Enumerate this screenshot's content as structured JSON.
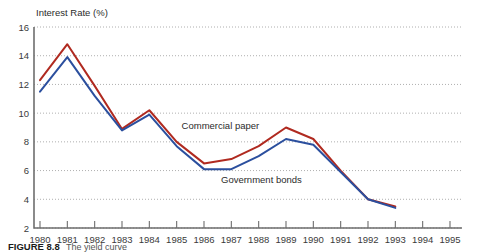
{
  "figure": {
    "caption_number": "FIGURE 8.8",
    "caption_text": "The  yield   curve"
  },
  "chart_data": {
    "type": "line",
    "title": "",
    "subtitle": "",
    "xlabel": "",
    "ylabel": "Interest Rate (%)",
    "ylim": [
      2,
      16
    ],
    "xlim": [
      1980,
      1995
    ],
    "yticks": [
      2,
      4,
      6,
      8,
      10,
      12,
      14,
      16
    ],
    "ytick_labels": [
      "2",
      "4",
      "6",
      "8",
      "10",
      "12",
      "14",
      "16"
    ],
    "grid": true,
    "grid_axis": "y",
    "legend_position": "inline-annotation",
    "categories": [
      1980,
      1981,
      1982,
      1983,
      1984,
      1985,
      1986,
      1987,
      1988,
      1989,
      1990,
      1991,
      1992,
      1993
    ],
    "xtick_labels": [
      "1980",
      "1981",
      "1982",
      "1983",
      "1984",
      "1985",
      "1986",
      "1987",
      "1988",
      "1989",
      "1990",
      "1991",
      "1992",
      "1993",
      "1994",
      "1995"
    ],
    "series": [
      {
        "name": "Commercial paper",
        "color": "#b02a20",
        "values": [
          12.3,
          14.8,
          11.9,
          8.9,
          10.2,
          8.0,
          6.5,
          6.8,
          7.7,
          9.0,
          8.2,
          6.0,
          4.0,
          3.5
        ]
      },
      {
        "name": "Government bonds",
        "color": "#2b4f9e",
        "values": [
          11.5,
          13.9,
          11.2,
          8.8,
          9.9,
          7.7,
          6.1,
          6.1,
          7.0,
          8.2,
          7.8,
          5.9,
          4.0,
          3.4
        ]
      }
    ],
    "annotations": [
      {
        "text": "Commercial paper",
        "x": 1986.6,
        "y": 8.9
      },
      {
        "text": "Government bonds",
        "x": 1988.1,
        "y": 5.1
      }
    ]
  },
  "colors": {
    "commercial_paper": "#b02a20",
    "government_bonds": "#2b4f9e",
    "axis": "#6e6e6e",
    "grid": "#9a9a9a",
    "text": "#2b2b2b",
    "background": "#ffffff"
  }
}
